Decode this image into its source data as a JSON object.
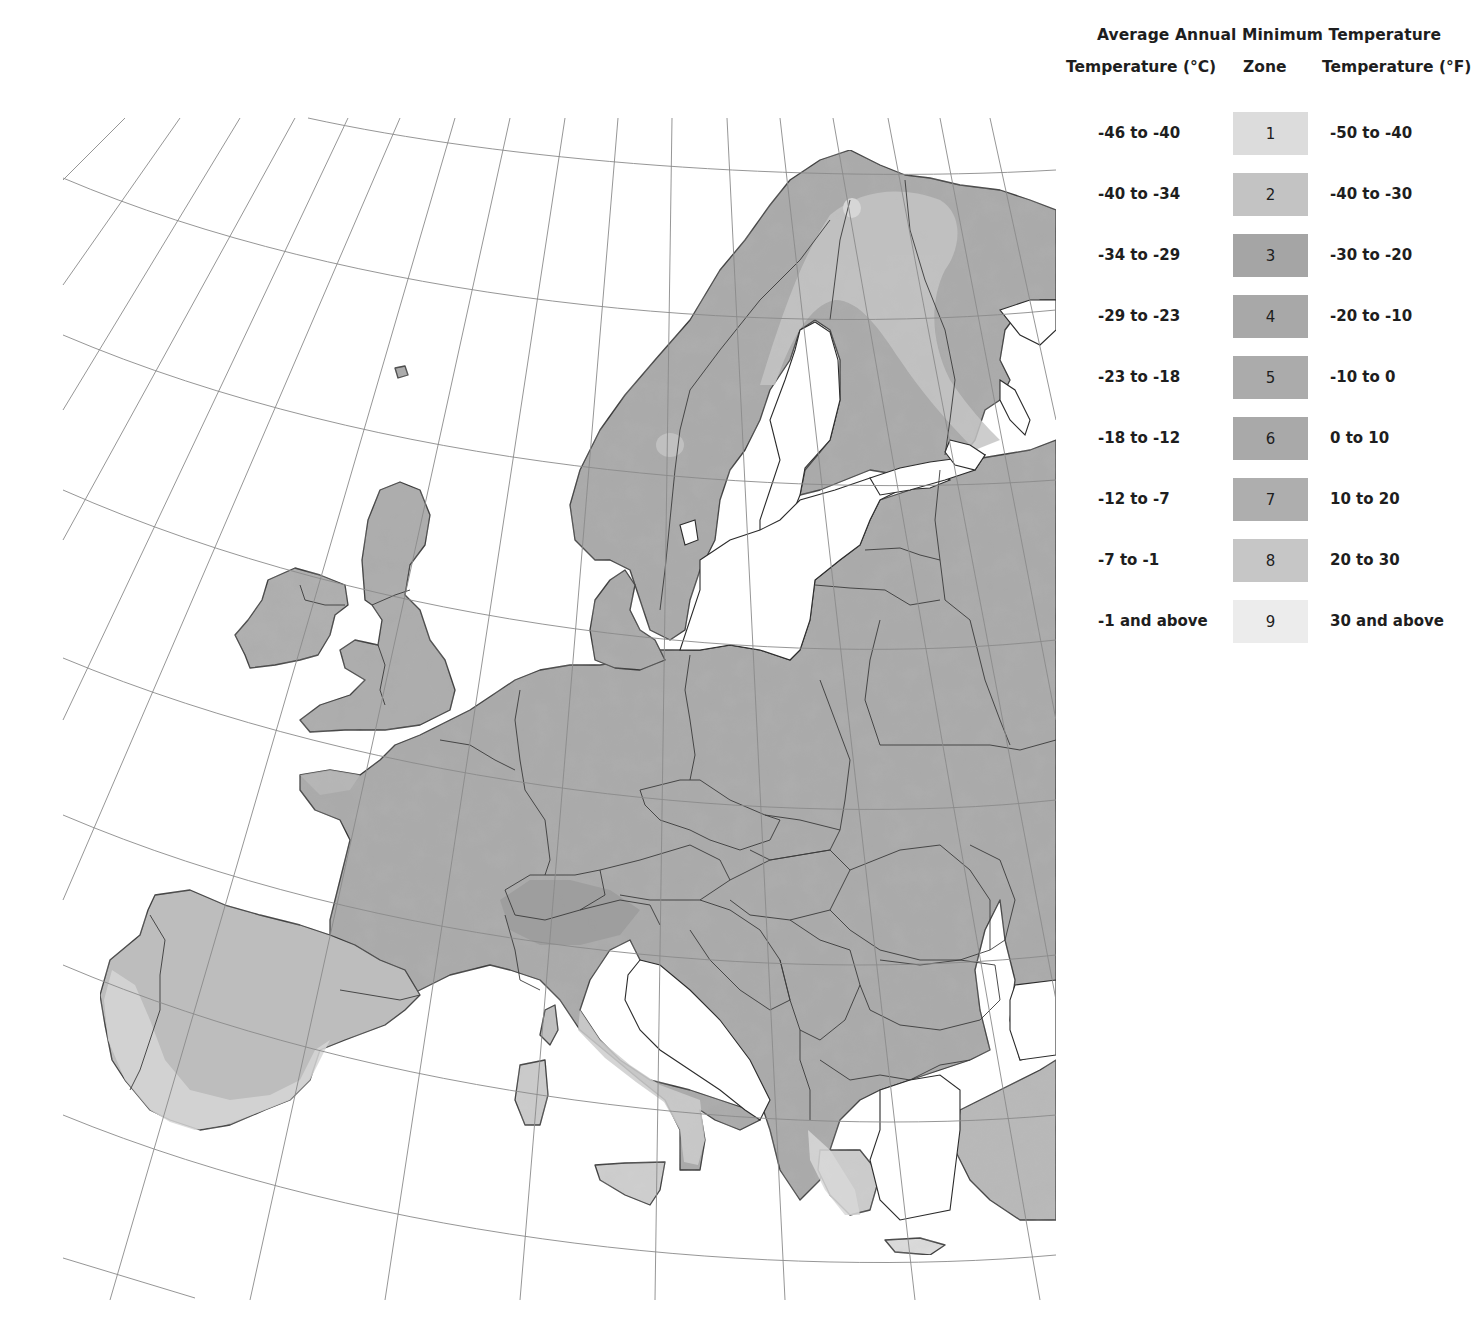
{
  "legend": {
    "title": "Average Annual Minimum Temperature",
    "columns": {
      "celsius": "Temperature (°C)",
      "zone": "Zone",
      "fahrenheit": "Temperature (°F)"
    },
    "rows": [
      {
        "celsius": "-46 to -40",
        "zone": "1",
        "fahrenheit": "-50 to -40",
        "color": "#dcdcdc"
      },
      {
        "celsius": "-40 to -34",
        "zone": "2",
        "fahrenheit": "-40 to -30",
        "color": "#c3c3c3"
      },
      {
        "celsius": "-34 to -29",
        "zone": "3",
        "fahrenheit": "-30 to -20",
        "color": "#a5a5a5"
      },
      {
        "celsius": "-29 to -23",
        "zone": "4",
        "fahrenheit": "-20 to -10",
        "color": "#a8a8a8"
      },
      {
        "celsius": "-23 to -18",
        "zone": "5",
        "fahrenheit": "-10 to 0",
        "color": "#ababab"
      },
      {
        "celsius": "-18 to -12",
        "zone": "6",
        "fahrenheit": "0 to 10",
        "color": "#a9a9a9"
      },
      {
        "celsius": "-12 to -7",
        "zone": "7",
        "fahrenheit": "10 to 20",
        "color": "#aeaeae"
      },
      {
        "celsius": "-7 to -1",
        "zone": "8",
        "fahrenheit": "20 to 30",
        "color": "#c6c6c6"
      },
      {
        "celsius": "-1 and above",
        "zone": "9",
        "fahrenheit": "30 and above",
        "color": "#ececec"
      }
    ]
  },
  "map": {
    "subject": "Europe plant hardiness zones",
    "style": "grayscale shaded relief with country borders and graticule",
    "colors": {
      "sea": "#ffffff",
      "land_base": "#a9a9a9",
      "zone_cold_light": "#c4c4c4",
      "zone_warm_light": "#c8c8c8",
      "zone_mild": "#e2e2e2",
      "coastline": "#2b2b2b",
      "graticule": "#8a8a8a"
    }
  }
}
